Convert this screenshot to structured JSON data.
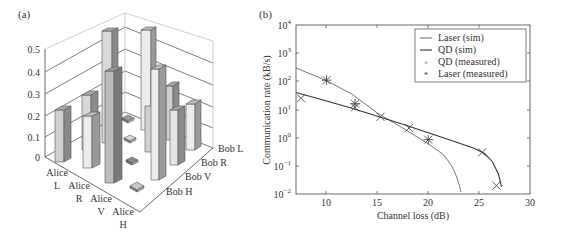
{
  "chart_data": [
    {
      "panel_label": "(a)",
      "type": "bar3d",
      "title": "",
      "zlabel": "",
      "zticks": [
        "0",
        "0.1",
        "0.2",
        "0.3",
        "0.4",
        "0.5"
      ],
      "zlim": [
        0,
        0.5
      ],
      "alice_labels": [
        "Alice L",
        "Alice R",
        "Alice V",
        "Alice H"
      ],
      "bob_labels": [
        "Bob H",
        "Bob V",
        "Bob R",
        "Bob L"
      ],
      "x_axis_name": "Alice",
      "y_axis_name": "Bob",
      "matrix_rows_alice_L_R_V_H_cols_bob_H_V_R_L": [
        [
          0.23,
          0.25,
          0.5,
          0.01
        ],
        [
          0.2,
          0.4,
          0.01,
          0.5
        ],
        [
          0.01,
          0.01,
          0.22,
          0.4
        ],
        [
          0.01,
          0.23,
          0.3,
          0.25
        ]
      ],
      "grid": true
    },
    {
      "panel_label": "(b)",
      "type": "line",
      "title": "",
      "xlabel": "Channel loss (dB)",
      "ylabel": "Communication rate (kB/s)",
      "xlim": [
        7,
        30
      ],
      "ylim": [
        0.01,
        10000
      ],
      "yscale": "log",
      "xticks": [
        "10",
        "15",
        "20",
        "25",
        "30"
      ],
      "yticks": [
        "10^-2",
        "10^-1",
        "10^0",
        "10^1",
        "10^2",
        "10^3",
        "10^4"
      ],
      "legend_position": "upper right",
      "series": [
        {
          "name": "Laser (sim)",
          "style": "line",
          "x": [
            7,
            10,
            12.5,
            15,
            17.5,
            20,
            21.5,
            22.3,
            22.8,
            23.1,
            23.2
          ],
          "y": [
            300,
            105,
            35,
            7.5,
            2.2,
            0.6,
            0.25,
            0.1,
            0.04,
            0.018,
            0.012
          ]
        },
        {
          "name": "QD (sim)",
          "style": "line",
          "x": [
            7,
            10,
            12.5,
            15,
            17.5,
            20,
            22.5,
            24.5,
            25.5,
            26.3,
            26.9,
            27.2
          ],
          "y": [
            40,
            20,
            11,
            5.8,
            3.0,
            1.5,
            0.75,
            0.42,
            0.28,
            0.14,
            0.05,
            0.018
          ]
        },
        {
          "name": "QD (measured)",
          "style": "marker-x",
          "x": [
            7.5,
            12.8,
            15.3,
            18.1,
            25.3,
            26.7
          ],
          "y": [
            25,
            12,
            5.5,
            2.2,
            0.3,
            0.02
          ]
        },
        {
          "name": "Laser (measured)",
          "style": "marker-star",
          "x": [
            10,
            12.8,
            20
          ],
          "y": [
            110,
            16,
            0.85
          ]
        }
      ]
    }
  ],
  "panel_a": {
    "label": "(a)",
    "zticks": [
      "0.5",
      "0.4",
      "0.3",
      "0.2",
      "0.1",
      "0"
    ],
    "alice": [
      {
        "name": "Alice",
        "state": "L"
      },
      {
        "name": "Alice",
        "state": "R"
      },
      {
        "name": "Alice",
        "state": "V"
      },
      {
        "name": "Alice",
        "state": "H"
      }
    ],
    "bob": [
      "Bob L",
      "Bob R",
      "Bob V",
      "Bob H"
    ]
  },
  "panel_b": {
    "label": "(b)",
    "xlabel": "Channel loss (dB)",
    "ylabel": "Communication rate (kB/s)",
    "xticks": [
      "10",
      "15",
      "20",
      "25",
      "30"
    ],
    "ytick_base": "10",
    "ytick_exps": [
      "4",
      "3",
      "2",
      "1",
      "0",
      "−1",
      "−2"
    ],
    "legend": [
      "Laser (sim)",
      "QD (sim)",
      "QD (measured)",
      "Laser (measured)"
    ]
  }
}
